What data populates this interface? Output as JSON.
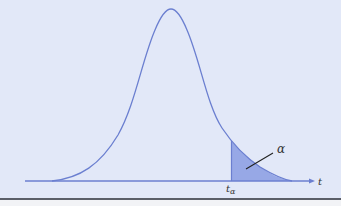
{
  "figure": {
    "type": "t-distribution right-tail area",
    "axis_label": "t",
    "critical_value_label": "t",
    "critical_value_subscript": "α",
    "area_label": "α",
    "colors": {
      "background": "#e2e8f8",
      "curve": "#6b7fd0",
      "shaded_area": "#97a8e6",
      "baseline": "#6b7fd0",
      "bottom_rule": "#5a5e68"
    }
  }
}
